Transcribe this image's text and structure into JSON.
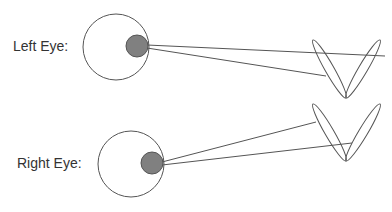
{
  "labels": {
    "left_eye": "Left Eye:",
    "right_eye": "Right Eye:"
  },
  "colors": {
    "stroke": "#555555",
    "pupil_fill": "#808080",
    "text": "#333333",
    "background": "#ffffff"
  },
  "diagram": {
    "left_eye": {
      "eyeball": {
        "cx": 116,
        "cy": 47,
        "r": 33
      },
      "pupil": {
        "cx": 137,
        "cy": 46,
        "r": 11
      },
      "rays": [
        {
          "x1": 147,
          "y1": 45,
          "x2": 385,
          "y2": 56
        },
        {
          "x1": 147,
          "y1": 48,
          "x2": 326,
          "y2": 76
        }
      ],
      "v_shape": {
        "apex": [
          346,
          98
        ],
        "left_tip": [
          313,
          40
        ],
        "right_tip": [
          380,
          40
        ]
      }
    },
    "right_eye": {
      "eyeball": {
        "cx": 131,
        "cy": 164,
        "r": 33
      },
      "pupil": {
        "cx": 152,
        "cy": 163,
        "r": 11
      },
      "rays": [
        {
          "x1": 162,
          "y1": 162,
          "x2": 316,
          "y2": 122
        },
        {
          "x1": 162,
          "y1": 165,
          "x2": 352,
          "y2": 143
        }
      ],
      "v_shape": {
        "apex": [
          346,
          161
        ],
        "left_tip": [
          313,
          104
        ],
        "right_tip": [
          380,
          104
        ]
      }
    }
  }
}
